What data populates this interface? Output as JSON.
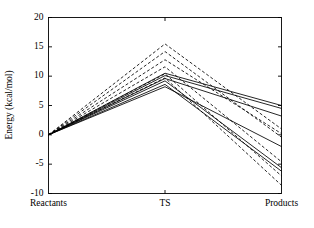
{
  "chart_data": {
    "type": "line",
    "title": "",
    "xlabel": "",
    "ylabel": "Energy (kcal/mol)",
    "categories": [
      "Reactants",
      "TS",
      "Products"
    ],
    "x_tick_labels": [
      "Reactants",
      "TS",
      "Products"
    ],
    "y_tick_labels": [
      "-10",
      "-5",
      "0",
      "5",
      "10",
      "15",
      "20"
    ],
    "y_tick_values": [
      -10,
      -5,
      0,
      5,
      10,
      15,
      20
    ],
    "ylim": [
      -10,
      20
    ],
    "grid": false,
    "legend": "none",
    "line_color": "#000000",
    "series": [
      {
        "name": "profile-1",
        "style": "dashed",
        "values": [
          0,
          15.5,
          1.0
        ]
      },
      {
        "name": "profile-2",
        "style": "dashed",
        "values": [
          0,
          14.2,
          -0.4
        ]
      },
      {
        "name": "profile-3",
        "style": "dashed",
        "values": [
          0,
          12.8,
          0.2
        ]
      },
      {
        "name": "profile-4",
        "style": "dashed",
        "values": [
          0,
          11.6,
          -4.6
        ]
      },
      {
        "name": "profile-5",
        "style": "dashed",
        "values": [
          0,
          10.4,
          -7.0
        ]
      },
      {
        "name": "profile-6",
        "style": "dashed",
        "values": [
          0,
          9.7,
          -8.6
        ]
      },
      {
        "name": "profile-7",
        "style": "solid",
        "values": [
          0,
          10.5,
          5.0
        ]
      },
      {
        "name": "profile-8",
        "style": "solid",
        "values": [
          0,
          10.1,
          4.5
        ]
      },
      {
        "name": "profile-9",
        "style": "solid",
        "values": [
          0,
          9.6,
          3.2
        ]
      },
      {
        "name": "profile-10",
        "style": "solid",
        "values": [
          0,
          9.2,
          -5.6
        ]
      },
      {
        "name": "profile-11",
        "style": "solid",
        "values": [
          0,
          8.6,
          -6.2
        ]
      },
      {
        "name": "profile-12",
        "style": "solid",
        "values": [
          0,
          8.2,
          -2.0
        ]
      }
    ]
  }
}
